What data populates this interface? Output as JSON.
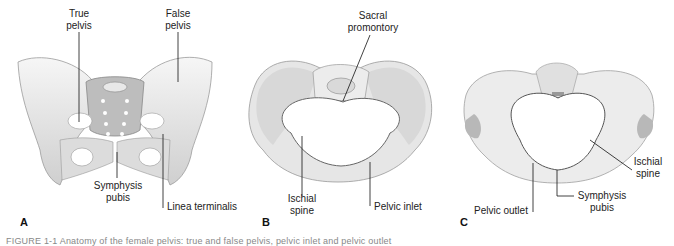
{
  "figure": {
    "caption": "FIGURE 1-1 Anatomy of the female pelvis: true and false pelvis, pelvic inlet and pelvic outlet",
    "panels": [
      {
        "letter": "A",
        "labels": {
          "true_pelvis": "True\npelvis",
          "true_pelvis_l1": "True",
          "true_pelvis_l2": "pelvis",
          "false_pelvis_l1": "False",
          "false_pelvis_l2": "pelvis",
          "symphysis_l1": "Symphysis",
          "symphysis_l2": "pubis",
          "linea_terminalis": "Linea terminalis"
        }
      },
      {
        "letter": "B",
        "labels": {
          "sacral_l1": "Sacral",
          "sacral_l2": "promontory",
          "ischial_l1": "Ischial",
          "ischial_l2": "spine",
          "pelvic_inlet": "Pelvic inlet"
        }
      },
      {
        "letter": "C",
        "labels": {
          "ischial_l1": "Ischial",
          "ischial_l2": "spine",
          "pelvic_outlet": "Pelvic outlet",
          "symphysis_l1": "Symphysis",
          "symphysis_l2": "pubis"
        }
      }
    ]
  },
  "colors": {
    "bone_light": "#f2f2f2",
    "bone_mid": "#d4d4d4",
    "bone_dark": "#a8a8a8",
    "outline": "#8a8a8a",
    "leader": "#111111"
  }
}
